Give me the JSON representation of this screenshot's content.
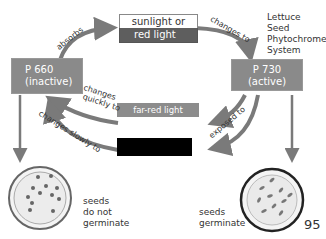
{
  "title": [
    "Lettuce",
    "Seed",
    "Phytochrome",
    "System"
  ],
  "states": {
    "p660": {
      "name": "P 660",
      "status": "(inactive)"
    },
    "p730": {
      "name": "P 730",
      "status": "(active)"
    }
  },
  "light_boxes": {
    "sunlight": {
      "line1": "sunlight or",
      "line2": "red light"
    },
    "far_red": "far-red light",
    "darkness": ""
  },
  "arrow_labels": {
    "absorbs": "absorbs",
    "changes_to": "changes to",
    "changes_quickly_to": [
      "changes",
      "quickly to"
    ],
    "changes_slowly_to": "changes slowly to",
    "exposed_to": "exposed to"
  },
  "outcomes": {
    "left": [
      "seeds",
      "do not",
      "germinate"
    ],
    "right": [
      "seeds",
      "germinate"
    ]
  },
  "page_number": "95",
  "colors": {
    "state_box": "#8a8a8a",
    "arrow": "#7a7a7a",
    "red_light": "#5e5e5e",
    "dark": "#000000"
  }
}
